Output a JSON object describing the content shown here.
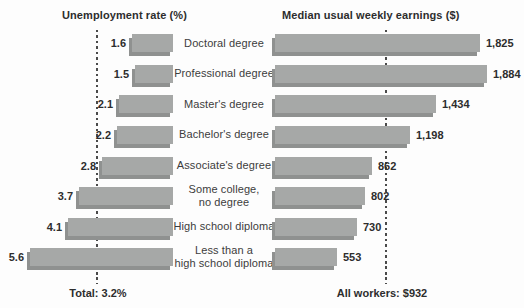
{
  "headers": {
    "left": "Unemployment rate (%)",
    "right": "Median usual weekly earnings ($)"
  },
  "footers": {
    "left": "Total: 3.2%",
    "right": "All workers: $932"
  },
  "rows": [
    {
      "label_lines": [
        "Doctoral degree"
      ],
      "unemployment": 1.6,
      "unemployment_label": "1.6",
      "earnings": 1825,
      "earnings_label": "1,825"
    },
    {
      "label_lines": [
        "Professional degree"
      ],
      "unemployment": 1.5,
      "unemployment_label": "1.5",
      "earnings": 1884,
      "earnings_label": "1,884"
    },
    {
      "label_lines": [
        "Master's degree"
      ],
      "unemployment": 2.1,
      "unemployment_label": "2.1",
      "earnings": 1434,
      "earnings_label": "1,434"
    },
    {
      "label_lines": [
        "Bachelor's degree"
      ],
      "unemployment": 2.2,
      "unemployment_label": "2.2",
      "earnings": 1198,
      "earnings_label": "1,198"
    },
    {
      "label_lines": [
        "Associate's degree"
      ],
      "unemployment": 2.8,
      "unemployment_label": "2.8",
      "earnings": 862,
      "earnings_label": "862"
    },
    {
      "label_lines": [
        "Some college,",
        "no degree"
      ],
      "unemployment": 3.7,
      "unemployment_label": "3.7",
      "earnings": 802,
      "earnings_label": "802"
    },
    {
      "label_lines": [
        "High school diploma"
      ],
      "unemployment": 4.1,
      "unemployment_label": "4.1",
      "earnings": 730,
      "earnings_label": "730"
    },
    {
      "label_lines": [
        "Less than a",
        "high school diploma"
      ],
      "unemployment": 5.6,
      "unemployment_label": "5.6",
      "earnings": 553,
      "earnings_label": "553"
    }
  ],
  "reference_lines": {
    "unemployment_total": 3.2,
    "earnings_all_workers": 932
  },
  "colors": {
    "bar": "#a6a8a7",
    "bar_shadow": "#8f9190",
    "text": "#2d2d2d",
    "label_text": "#3c3c3c",
    "dash": "#4a4a4a",
    "background": "#fdfdfd"
  },
  "chart_data": {
    "type": "bar",
    "orientation": "horizontal-paired-pyramid",
    "categories": [
      "Doctoral degree",
      "Professional degree",
      "Master's degree",
      "Bachelor's degree",
      "Associate's degree",
      "Some college, no degree",
      "High school diploma",
      "Less than a high school diploma"
    ],
    "series": [
      {
        "name": "Unemployment rate (%)",
        "axis": "left",
        "values": [
          1.6,
          1.5,
          2.1,
          2.2,
          2.8,
          3.7,
          4.1,
          5.6
        ]
      },
      {
        "name": "Median usual weekly earnings ($)",
        "axis": "right",
        "values": [
          1825,
          1884,
          1434,
          1198,
          862,
          802,
          730,
          553
        ]
      }
    ],
    "reference_lines": [
      {
        "series": "Unemployment rate (%)",
        "value": 3.2,
        "label": "Total: 3.2%"
      },
      {
        "series": "Median usual weekly earnings ($)",
        "value": 932,
        "label": "All workers: $932"
      }
    ],
    "title": "",
    "xlabel": "",
    "ylabel": "",
    "grid": false,
    "legend_position": "none",
    "left_axis_range": [
      0,
      6.8
    ],
    "right_axis_range": [
      0,
      2000
    ]
  }
}
